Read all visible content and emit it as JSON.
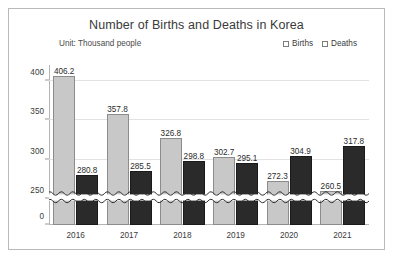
{
  "chart_data": {
    "type": "bar",
    "title": "Number of Births and Deaths in Korea",
    "subtitle": "Unit: Thousand people",
    "xlabel": "",
    "ylabel": "",
    "categories": [
      "2016",
      "2017",
      "2018",
      "2019",
      "2020",
      "2021"
    ],
    "series": [
      {
        "name": "Births",
        "color": "#c8c8c8",
        "values": [
          406.2,
          357.8,
          326.8,
          302.7,
          272.3,
          260.5
        ]
      },
      {
        "name": "Deaths",
        "color": "#2a2a2a",
        "values": [
          280.8,
          285.5,
          298.8,
          295.1,
          304.9,
          317.8
        ]
      }
    ],
    "yticks": [
      0,
      250,
      300,
      350,
      400
    ],
    "ytick_labels": [
      "0",
      "250",
      "300",
      "350",
      "400"
    ],
    "ylim": [
      0,
      420
    ],
    "axis_break": {
      "present": true,
      "style": "double-wave",
      "between": [
        0,
        250
      ]
    },
    "grid": "horizontal",
    "legend_position": "top-right"
  },
  "legend": {
    "entries": [
      {
        "label": "Births"
      },
      {
        "label": "Deaths"
      }
    ]
  }
}
